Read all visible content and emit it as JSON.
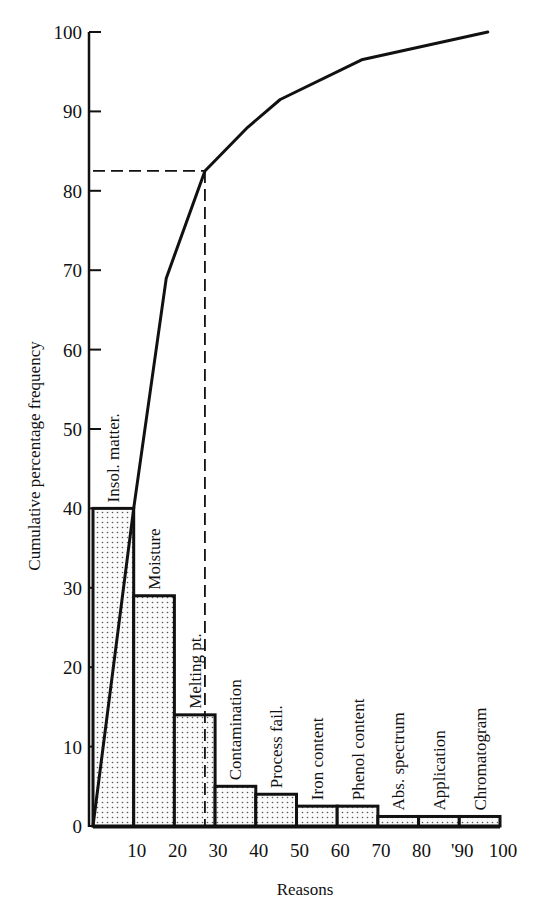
{
  "chart_data": {
    "type": "bar",
    "subtype": "pareto",
    "title": "",
    "xlabel": "Reasons",
    "ylabel": "Cumulative percentage frequency",
    "xlim": [
      0,
      100
    ],
    "ylim": [
      0,
      100
    ],
    "x_ticks": [
      "10",
      "20",
      "30",
      "40",
      "50",
      "60",
      "70",
      "80",
      "'90",
      "100"
    ],
    "y_ticks": [
      "0",
      "10",
      "20",
      "30",
      "40",
      "50",
      "60",
      "70",
      "80",
      "90",
      "100"
    ],
    "grid": false,
    "legend": null,
    "categories": [
      "Insol. matter.",
      "Moisture",
      "Melting pt.",
      "Contamination",
      "Process fail.",
      "Iron content",
      "Phenol content",
      "Abs. spectrum",
      "Application",
      "Chromatogram"
    ],
    "series": [
      {
        "name": "Frequency (%)",
        "type": "bar",
        "x_ranges": [
          [
            0,
            10
          ],
          [
            10,
            20
          ],
          [
            20,
            30
          ],
          [
            30,
            40
          ],
          [
            40,
            50
          ],
          [
            50,
            60
          ],
          [
            60,
            70
          ],
          [
            70,
            80
          ],
          [
            80,
            90
          ],
          [
            90,
            100
          ]
        ],
        "values": [
          40,
          29,
          14,
          5,
          4,
          2.5,
          2.5,
          1.2,
          1.2,
          1.2
        ]
      },
      {
        "name": "Cumulative percentage",
        "type": "line",
        "points": [
          [
            0,
            0
          ],
          [
            10,
            40
          ],
          [
            18,
            69
          ],
          [
            27.5,
            82.5
          ],
          [
            38,
            88
          ],
          [
            46,
            91.5
          ],
          [
            66,
            96.5
          ],
          [
            97,
            100
          ]
        ]
      }
    ],
    "annotations": [
      {
        "type": "dashed-guide",
        "x": 27.5,
        "y": 82.5,
        "description": "dashed lines from cumulative point to both axes"
      }
    ]
  }
}
